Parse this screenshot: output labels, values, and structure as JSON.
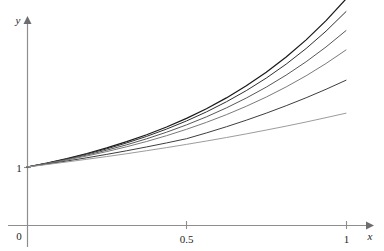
{
  "figure": {
    "background": "#ffffff",
    "top_caption": "",
    "axis_color": "#8e8e8e",
    "text_color": "#1e1e1e"
  },
  "axes": {
    "x_label": "x",
    "y_label": "y",
    "origin_label": "0",
    "x_ticks": [
      {
        "value": 0.5,
        "label": "0.5"
      },
      {
        "value": 1.0,
        "label": "1"
      }
    ],
    "y_ticks": [
      {
        "value": 1.0,
        "label": "1"
      }
    ]
  },
  "chart_data": {
    "type": "line",
    "title": "",
    "xlabel": "x",
    "ylabel": "y",
    "xlim": [
      0,
      1.12
    ],
    "ylim": [
      0,
      3.3
    ],
    "grid": false,
    "legend": "none",
    "x": [
      0,
      0.0625,
      0.125,
      0.1875,
      0.25,
      0.3125,
      0.375,
      0.4375,
      0.5,
      0.5625,
      0.625,
      0.6875,
      0.75,
      0.8125,
      0.875,
      0.9375,
      1.0
    ],
    "series": [
      {
        "name": "exact-solution",
        "color": "#1a1a1a",
        "width": 1.25,
        "values": [
          1.0,
          1.069,
          1.146,
          1.233,
          1.329,
          1.436,
          1.556,
          1.689,
          1.838,
          2.005,
          2.191,
          2.4,
          2.634,
          2.897,
          3.192,
          3.523,
          3.897
        ]
      },
      {
        "name": "approximation-n-16",
        "color": "#2f2f2f",
        "width": 1.0,
        "values": [
          1.0,
          1.066,
          1.139,
          1.222,
          1.313,
          1.415,
          1.528,
          1.654,
          1.794,
          1.95,
          2.124,
          2.317,
          2.533,
          2.774,
          3.043,
          3.343,
          3.679
        ]
      },
      {
        "name": "approximation-n-8",
        "color": "#575757",
        "width": 1.0,
        "values": [
          1.0,
          1.062,
          1.13,
          1.206,
          1.29,
          1.383,
          1.486,
          1.6,
          1.726,
          1.865,
          2.019,
          2.189,
          2.377,
          2.585,
          2.815,
          3.07,
          3.352
        ]
      },
      {
        "name": "approximation-n-4",
        "color": "#7a7a7a",
        "width": 1.0,
        "values": [
          1.0,
          1.058,
          1.121,
          1.19,
          1.266,
          1.349,
          1.44,
          1.54,
          1.65,
          1.77,
          1.902,
          2.047,
          2.206,
          2.381,
          2.573,
          2.785,
          3.018
        ]
      },
      {
        "name": "approximation-n-2",
        "color": "#3d3d3d",
        "width": 1.0,
        "values": [
          1.0,
          1.05,
          1.103,
          1.159,
          1.218,
          1.28,
          1.346,
          1.415,
          1.488,
          1.588,
          1.694,
          1.807,
          1.928,
          2.057,
          2.194,
          2.34,
          2.496
        ]
      },
      {
        "name": "approximation-n-1",
        "color": "#9c9c9c",
        "width": 1.0,
        "values": [
          1.0,
          1.043,
          1.087,
          1.133,
          1.18,
          1.229,
          1.281,
          1.334,
          1.39,
          1.448,
          1.508,
          1.571,
          1.637,
          1.705,
          1.776,
          1.851,
          1.928
        ]
      }
    ]
  },
  "geometry": {
    "x_origin_px": 27,
    "y_origin_px": 225,
    "px_per_x_unit": 319,
    "px_per_y_unit": 58
  }
}
